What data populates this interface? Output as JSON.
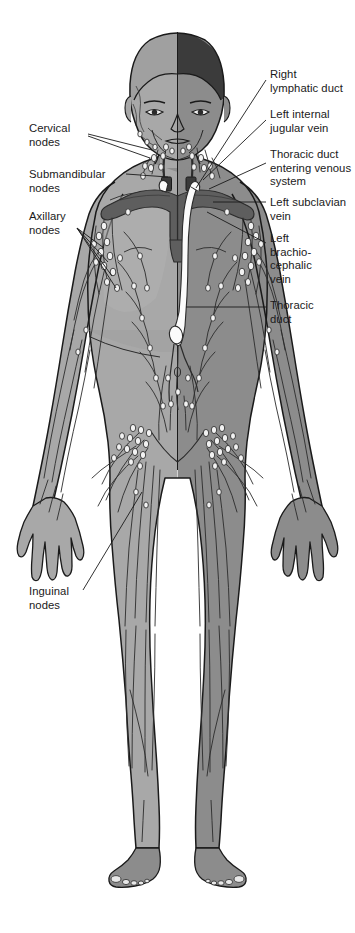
{
  "figure": {
    "name": "lymphatic-system-anterior-view",
    "background_color": "#ffffff",
    "width": 355,
    "height": 933,
    "colors": {
      "body_right_shaded": "#8c8c8c",
      "body_left_dissected": "#a8a8a8",
      "skin_outline": "#1a1a1a",
      "hair_dark": "#3b3b3b",
      "vein_dark": "#5e5e5e",
      "vein_outline": "#2b2b2b",
      "lymph_node_fill": "#f2f2f2",
      "lymph_vessel": "#2b2b2b",
      "thoracic_duct_fill": "#fbfbfb",
      "leader_line": "#1a1a1a",
      "label_text": "#1a1a1a"
    }
  },
  "labels": [
    {
      "id": "cervical-nodes",
      "text": "Cervical\nnodes",
      "side": "left",
      "x": 29,
      "y": 122,
      "leader": [
        [
          88,
          134
        ],
        [
          152,
          150
        ]
      ]
    },
    {
      "id": "submandibular-nodes",
      "text": "Submandibular\nnodes",
      "side": "left",
      "x": 29,
      "y": 168,
      "leader": [
        [
          126,
          174
        ],
        [
          165,
          178
        ]
      ]
    },
    {
      "id": "axillary-nodes",
      "text": "Axillary\nnodes",
      "side": "left",
      "x": 29,
      "y": 210,
      "leader": [
        [
          77,
          228
        ],
        [
          104,
          248
        ]
      ]
    },
    {
      "id": "inguinal-nodes",
      "text": "Inguinal\nnodes",
      "side": "left",
      "x": 29,
      "y": 585,
      "leader": [
        [
          83,
          590
        ],
        [
          142,
          492
        ]
      ]
    },
    {
      "id": "right-lymphatic-duct",
      "text": "Right\nlymphatic duct",
      "side": "right",
      "x": 270,
      "y": 68,
      "leader": [
        [
          266,
          80
        ],
        [
          196,
          188
        ]
      ]
    },
    {
      "id": "left-internal-jugular-vein",
      "text": "Left internal\njugular vein",
      "side": "right",
      "x": 270,
      "y": 108,
      "leader": [
        [
          266,
          120
        ],
        [
          205,
          180
        ]
      ]
    },
    {
      "id": "thoracic-duct-entering-venous-system",
      "text": "Thoracic duct\nentering venous\nsystem",
      "side": "right",
      "x": 270,
      "y": 148,
      "leader": [
        [
          266,
          160
        ],
        [
          208,
          190
        ]
      ]
    },
    {
      "id": "left-subclavian-vein",
      "text": "Left subclavian\nvein",
      "side": "right",
      "x": 270,
      "y": 196,
      "leader": [
        [
          266,
          202
        ],
        [
          212,
          202
        ]
      ]
    },
    {
      "id": "left-brachiocephalic-vein",
      "text": "Left\nbrachio-\ncephalic\nvein",
      "side": "right",
      "x": 270,
      "y": 232,
      "leader": [
        [
          266,
          243
        ],
        [
          208,
          212
        ]
      ]
    },
    {
      "id": "thoracic-duct",
      "text": "Thoracic\nduct",
      "side": "right",
      "x": 270,
      "y": 299,
      "leader": [
        [
          266,
          307
        ],
        [
          186,
          307
        ]
      ]
    }
  ],
  "anatomy_parts": [
    {
      "id": "head",
      "name": "head"
    },
    {
      "id": "hair",
      "name": "hair"
    },
    {
      "id": "face",
      "name": "face"
    },
    {
      "id": "neck",
      "name": "neck"
    },
    {
      "id": "torso",
      "name": "torso"
    },
    {
      "id": "arms",
      "name": "arms"
    },
    {
      "id": "hands",
      "name": "hands"
    },
    {
      "id": "legs",
      "name": "legs"
    },
    {
      "id": "feet",
      "name": "feet"
    },
    {
      "id": "subclavian-veins",
      "name": "subclavian-veins"
    },
    {
      "id": "thoracic-duct-vessel",
      "name": "thoracic-duct"
    },
    {
      "id": "cisterna-chyli",
      "name": "cisterna-chyli"
    },
    {
      "id": "lymph-vessels",
      "name": "lymphatic-vessels"
    },
    {
      "id": "lymph-nodes",
      "name": "lymph-nodes"
    }
  ]
}
